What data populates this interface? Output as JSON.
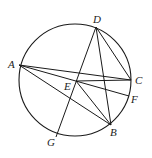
{
  "diagram": {
    "type": "geometry-circle",
    "circle": {
      "cx": 75,
      "cy": 80,
      "r": 56
    },
    "points": {
      "A": {
        "label": "A",
        "x": 19,
        "y": 65,
        "lx": 8,
        "ly": 68
      },
      "D": {
        "label": "D",
        "x": 96,
        "y": 27,
        "lx": 93,
        "ly": 23
      },
      "C": {
        "label": "C",
        "x": 131,
        "y": 80,
        "lx": 135,
        "ly": 84
      },
      "F": {
        "label": "F",
        "x": 129,
        "y": 96,
        "lx": 131,
        "ly": 103
      },
      "B": {
        "label": "B",
        "x": 111,
        "y": 125,
        "lx": 110,
        "ly": 136
      },
      "G": {
        "label": "G",
        "x": 56,
        "y": 137,
        "lx": 47,
        "ly": 146
      },
      "E": {
        "label": "E",
        "x": 76,
        "y": 81,
        "lx": 64,
        "ly": 90
      }
    },
    "segments": [
      [
        "A",
        "C"
      ],
      [
        "A",
        "F"
      ],
      [
        "A",
        "B"
      ],
      [
        "D",
        "G"
      ],
      [
        "D",
        "C"
      ],
      [
        "D",
        "B"
      ],
      [
        "E",
        "C"
      ],
      [
        "E",
        "B"
      ]
    ],
    "stroke_color": "#1a1a1a"
  }
}
